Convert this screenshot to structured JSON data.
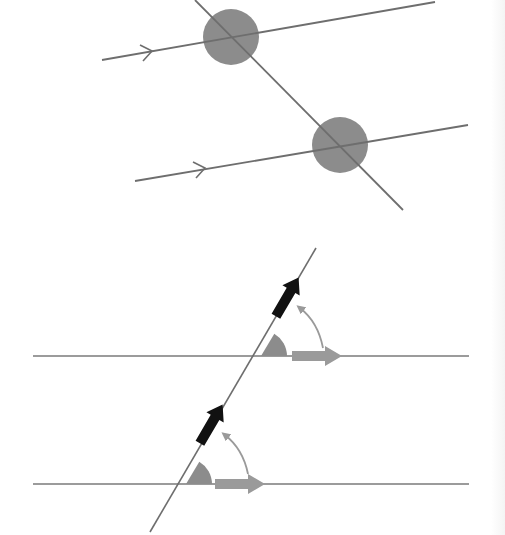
{
  "figure": {
    "colors": {
      "line": "#6e6e6e",
      "angle_fill": "#8c8c8c",
      "dark_arrow": "#111111",
      "light_arrow": "#9a9a9a",
      "curved_arrow": "#9a9a9a",
      "background": "#ffffff"
    },
    "top_diagram": {
      "parallel_lines": [
        {
          "x1": 102,
          "y1": 60,
          "x2": 435,
          "y2": 2,
          "arrow_mark_x": 150
        },
        {
          "x1": 135,
          "y1": 181,
          "x2": 468,
          "y2": 125,
          "arrow_mark_x": 205
        }
      ],
      "transversal": {
        "x1": 195,
        "y1": 0,
        "x2": 403,
        "y2": 210
      },
      "angle_disks": [
        {
          "cx": 231,
          "cy": 37,
          "r": 28
        },
        {
          "cx": 340,
          "cy": 145,
          "r": 28
        }
      ]
    },
    "bottom_diagram": {
      "parallel_lines": [
        {
          "x1": 33,
          "y1": 356,
          "x2": 469,
          "y2": 356
        },
        {
          "x1": 33,
          "y1": 484,
          "x2": 469,
          "y2": 484
        }
      ],
      "transversal": {
        "x1": 150,
        "y1": 532,
        "x2": 316,
        "y2": 248
      },
      "corresponding_angles": [
        {
          "vertex_x": 261,
          "vertex_y": 356,
          "radius": 26
        },
        {
          "vertex_x": 186,
          "vertex_y": 484,
          "radius": 26
        }
      ]
    }
  }
}
